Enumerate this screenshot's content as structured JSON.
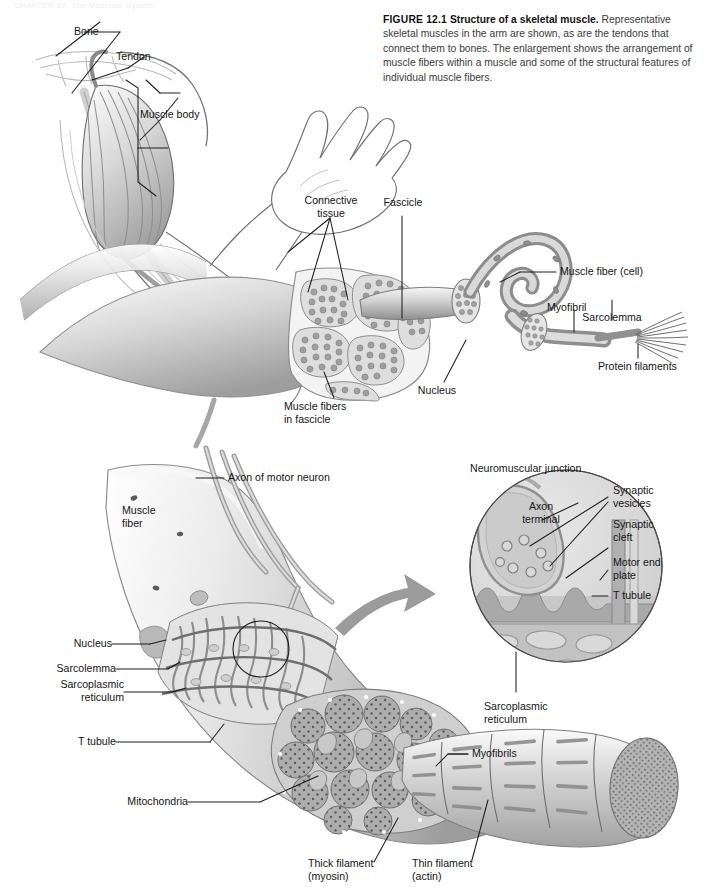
{
  "page": {
    "background": "#ffffff",
    "width": 712,
    "height": 888,
    "running_head": "CHAPTER 12  The Muscular System"
  },
  "caption": {
    "figure_number": "FIGURE 12.1",
    "title": "Structure of a skeletal muscle.",
    "body": "Representative skeletal muscles in the arm are shown, as are the tendons that connect them to bones. The enlargement shows the arrangement of muscle fibers within a muscle and some of the structural features of individual muscle fibers."
  },
  "panels": {
    "arm": {
      "name": "whole-muscle-arm-illustration",
      "labels": [
        {
          "id": "bone",
          "text": "Bone"
        },
        {
          "id": "tendon",
          "text": "Tendon"
        },
        {
          "id": "muscle-body",
          "text": "Muscle body"
        }
      ]
    },
    "muscle_detail": {
      "name": "muscle-fascicle-fiber-enlargement",
      "labels": [
        {
          "id": "connective-tissue",
          "text": "Connective\ntissue"
        },
        {
          "id": "fascicle",
          "text": "Fascicle"
        },
        {
          "id": "muscle-fiber-cell",
          "text": "Muscle fiber (cell)"
        },
        {
          "id": "myofibril",
          "text": "Myofibril"
        },
        {
          "id": "protein-filaments",
          "text": "Protein filaments"
        },
        {
          "id": "sarcolemma",
          "text": "Sarcolemma"
        },
        {
          "id": "nucleus",
          "text": "Nucleus"
        },
        {
          "id": "muscle-fibers-in-fascicle",
          "text": "Muscle fibers\nin fascicle"
        }
      ]
    },
    "fiber_detail": {
      "name": "muscle-fiber-ultrastructure",
      "labels": [
        {
          "id": "axon-of-motor-neuron",
          "text": "Axon of motor neuron"
        },
        {
          "id": "muscle-fiber",
          "text": "Muscle\nfiber"
        },
        {
          "id": "nucleus",
          "text": "Nucleus"
        },
        {
          "id": "sarcolemma",
          "text": "Sarcolemma"
        },
        {
          "id": "sarcoplasmic-reticulum",
          "text": "Sarcoplasmic\nreticulum"
        },
        {
          "id": "t-tubule",
          "text": "T tubule"
        },
        {
          "id": "myofibrils",
          "text": "Myofibrils"
        },
        {
          "id": "mitochondria",
          "text": "Mitochondria"
        },
        {
          "id": "thick-filament",
          "text": "Thick filament\n(myosin)"
        },
        {
          "id": "thin-filament",
          "text": "Thin filament\n(actin)"
        }
      ]
    },
    "nmj_inset": {
      "name": "neuromuscular-junction-inset",
      "labels": [
        {
          "id": "neuromuscular-junction",
          "text": "Neuromuscular junction"
        },
        {
          "id": "axon-terminal",
          "text": "Axon\nterminal"
        },
        {
          "id": "synaptic-vesicles",
          "text": "Synaptic\nvesicles"
        },
        {
          "id": "synaptic-cleft",
          "text": "Synaptic\ncleft"
        },
        {
          "id": "motor-end-plate",
          "text": "Motor end\nplate"
        },
        {
          "id": "t-tubule",
          "text": "T tubule"
        },
        {
          "id": "sarcoplasmic-reticulum",
          "text": "Sarcoplasmic\nreticulum"
        }
      ]
    }
  },
  "colors": {
    "ink": "#151515",
    "leader": "#1d1d1d",
    "tissue_light": "#f0f0f0",
    "tissue_mid": "#c9c9c9",
    "tissue_dark": "#9a9a9a",
    "arrow": "#9b9b9b"
  }
}
